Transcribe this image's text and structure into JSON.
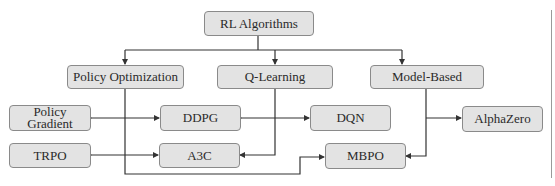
{
  "diagram": {
    "title": "RL Algorithms",
    "root": {
      "id": "root",
      "label": "RL Algorithms"
    },
    "categories": [
      {
        "id": "po",
        "label": "Policy Optimization"
      },
      {
        "id": "ql",
        "label": "Q-Learning"
      },
      {
        "id": "mb",
        "label": "Model-Based"
      }
    ],
    "algorithms": [
      {
        "id": "pg",
        "label": "Policy Gradient"
      },
      {
        "id": "ddpg",
        "label": "DDPG"
      },
      {
        "id": "dqn",
        "label": "DQN"
      },
      {
        "id": "alphazero",
        "label": "AlphaZero"
      },
      {
        "id": "trpo",
        "label": "TRPO"
      },
      {
        "id": "a3c",
        "label": "A3C"
      },
      {
        "id": "mbpo",
        "label": "MBPO"
      }
    ],
    "edges": [
      {
        "from": "root",
        "to": "po"
      },
      {
        "from": "root",
        "to": "ql"
      },
      {
        "from": "root",
        "to": "mb"
      },
      {
        "from": "po",
        "to": "pg",
        "bidirectional": true
      },
      {
        "from": "po",
        "to": "ddpg",
        "bidirectional": true
      },
      {
        "from": "po",
        "to": "trpo",
        "bidirectional": true
      },
      {
        "from": "po",
        "to": "a3c",
        "bidirectional": true
      },
      {
        "from": "po",
        "to": "mbpo"
      },
      {
        "from": "ql",
        "to": "ddpg"
      },
      {
        "from": "ql",
        "to": "dqn"
      },
      {
        "from": "ql",
        "to": "a3c"
      },
      {
        "from": "mb",
        "to": "alphazero"
      },
      {
        "from": "mb",
        "to": "mbpo"
      }
    ]
  },
  "colors": {
    "node_fill": "#e3e3e3",
    "node_border": "#8a8a8a",
    "edge": "#333333"
  }
}
